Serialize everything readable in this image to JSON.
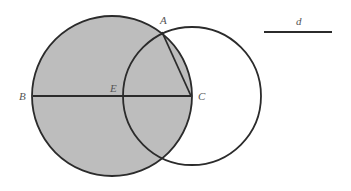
{
  "diagram": {
    "type": "geometry",
    "colors": {
      "fill": "#bdbdbd",
      "stroke": "#2b2b2b",
      "background": "#ffffff"
    },
    "circles": [
      {
        "name": "big-circle",
        "cx": 112,
        "cy": 96,
        "r": 80,
        "filled": true
      },
      {
        "name": "small-circle",
        "cx": 192,
        "cy": 96,
        "r": 69,
        "filled": false
      }
    ],
    "segments": [
      {
        "name": "segment-BC",
        "from": "B",
        "to": "C"
      },
      {
        "name": "segment-AC",
        "from": "A",
        "to": "C"
      },
      {
        "name": "segment-d",
        "label": "d"
      }
    ],
    "points": {
      "A": {
        "label": "A",
        "x": 162,
        "y": 32
      },
      "B": {
        "label": "B",
        "x": 33,
        "y": 96
      },
      "C": {
        "label": "C",
        "x": 191,
        "y": 96
      },
      "E": {
        "label": "E",
        "x": 124,
        "y": 96
      }
    },
    "length_label": "d"
  }
}
